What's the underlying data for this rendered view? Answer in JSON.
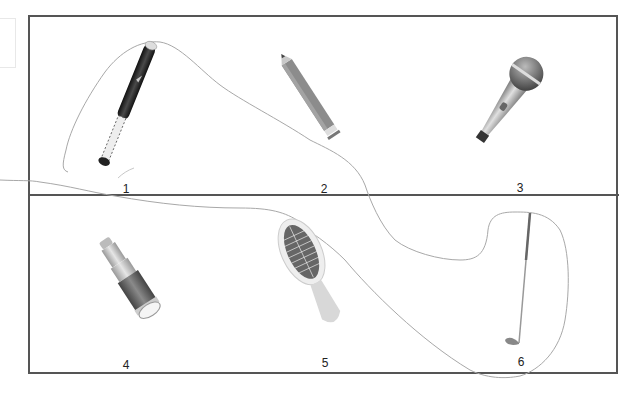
{
  "items": [
    {
      "number": "1",
      "name": "baseball bat"
    },
    {
      "number": "2",
      "name": "pencil"
    },
    {
      "number": "3",
      "name": "microphone"
    },
    {
      "number": "4",
      "name": "telescope"
    },
    {
      "number": "5",
      "name": "hairbrush"
    },
    {
      "number": "6",
      "name": "golf club"
    }
  ],
  "colors": {
    "frame": "#555555",
    "trace_line": "#9a9a9a",
    "bat": "#2b2b2b",
    "pencil": "#8a8a8a",
    "microphone": "#a9a9a9",
    "telescope": "#6d6d6d",
    "hairbrush": "#c8c8c8",
    "golf_club": "#888888"
  }
}
